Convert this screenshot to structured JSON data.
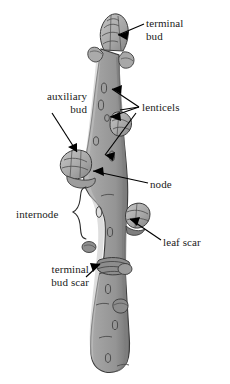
{
  "figure": {
    "background_color": "#ffffff",
    "twig_color": "#9a9a9a",
    "twig_shadow_color": "#6f6f6f",
    "twig_highlight_color": "#c0c0c0",
    "outline_color": "#3a3a3a",
    "label_color": "#1a1a1a",
    "leader_color": "#000000"
  },
  "labels": {
    "terminal_bud": "terminal\nbud",
    "lenticels": "lenticels",
    "auxiliary_bud": "auxiliary\nbud",
    "node": "node",
    "internode": "internode",
    "leaf_scar": "leaf scar",
    "terminal_bud_scar": "terminal\nbud scar"
  },
  "parts": [
    {
      "id": "terminal-bud",
      "label": "terminal bud",
      "count": 1
    },
    {
      "id": "lenticels",
      "label": "lenticels",
      "count": 2
    },
    {
      "id": "auxiliary-bud",
      "label": "auxiliary bud",
      "count": 1
    },
    {
      "id": "node",
      "label": "node",
      "count": 1
    },
    {
      "id": "internode",
      "label": "internode",
      "count": 1
    },
    {
      "id": "leaf-scar",
      "label": "leaf scar",
      "count": 1
    },
    {
      "id": "terminal-bud-scar",
      "label": "terminal bud scar",
      "count": 1
    }
  ]
}
